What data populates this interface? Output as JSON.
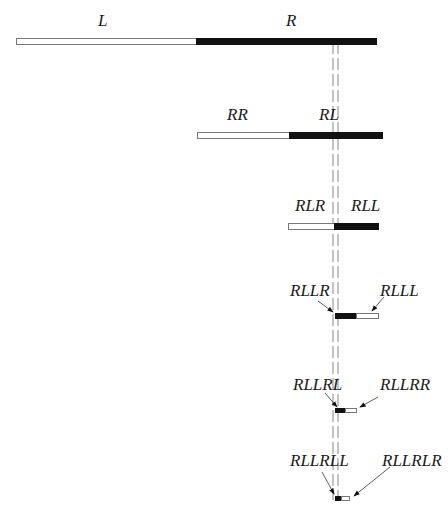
{
  "diagram": {
    "levels": [
      {
        "left_label": "L",
        "right_label": "R"
      },
      {
        "left_label": "RR",
        "right_label": "RL"
      },
      {
        "left_label": "RLR",
        "right_label": "RLL"
      },
      {
        "left_label": "RLLR",
        "right_label": "RLLL"
      },
      {
        "left_label": "RLLRL",
        "right_label": "RLLRR"
      },
      {
        "left_label": "RLLRLL",
        "right_label": "RLLRLR"
      }
    ],
    "colors": {
      "filled": "#111111",
      "empty": "#ffffff",
      "outline": "#777777",
      "guide": "#888888"
    }
  }
}
